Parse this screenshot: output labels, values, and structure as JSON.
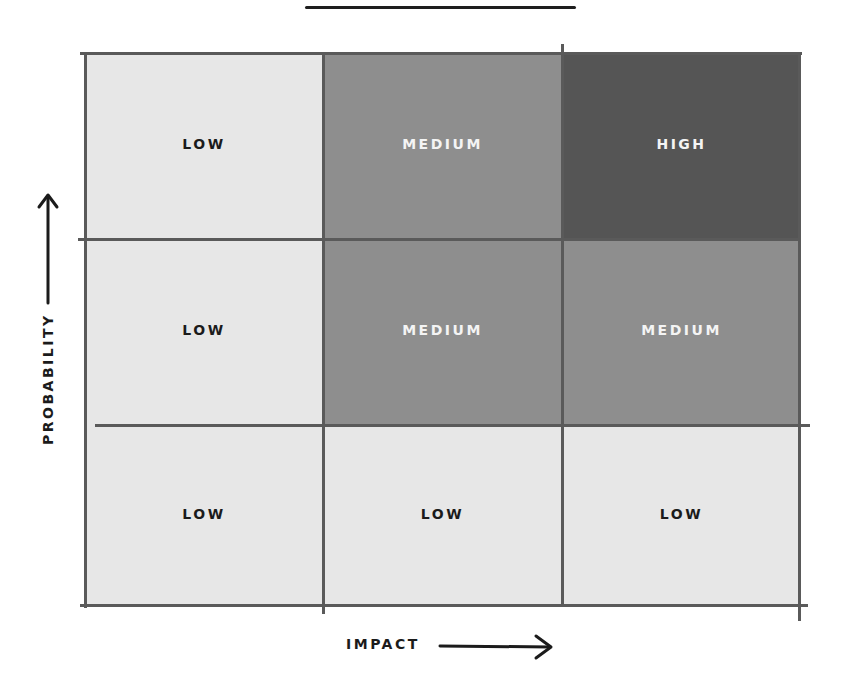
{
  "title": "",
  "axes": {
    "y_label": "PROBABILITY",
    "x_label": "IMPACT"
  },
  "colors": {
    "low": "#e7e7e7",
    "medium": "#8e8e8e",
    "high": "#555555",
    "grid_line": "#5a5a5a"
  },
  "matrix": {
    "rows": [
      {
        "probability": "high",
        "cells": [
          {
            "level": "low",
            "label": "LOW"
          },
          {
            "level": "medium",
            "label": "MEDIUM"
          },
          {
            "level": "high",
            "label": "HIGH"
          }
        ]
      },
      {
        "probability": "medium",
        "cells": [
          {
            "level": "low",
            "label": "LOW"
          },
          {
            "level": "medium",
            "label": "MEDIUM"
          },
          {
            "level": "medium",
            "label": "MEDIUM"
          }
        ]
      },
      {
        "probability": "low",
        "cells": [
          {
            "level": "low",
            "label": "LOW"
          },
          {
            "level": "low",
            "label": "LOW"
          },
          {
            "level": "low",
            "label": "LOW"
          }
        ]
      }
    ]
  },
  "icons": {
    "y_arrow": "arrow-up-icon",
    "x_arrow": "arrow-right-icon"
  }
}
